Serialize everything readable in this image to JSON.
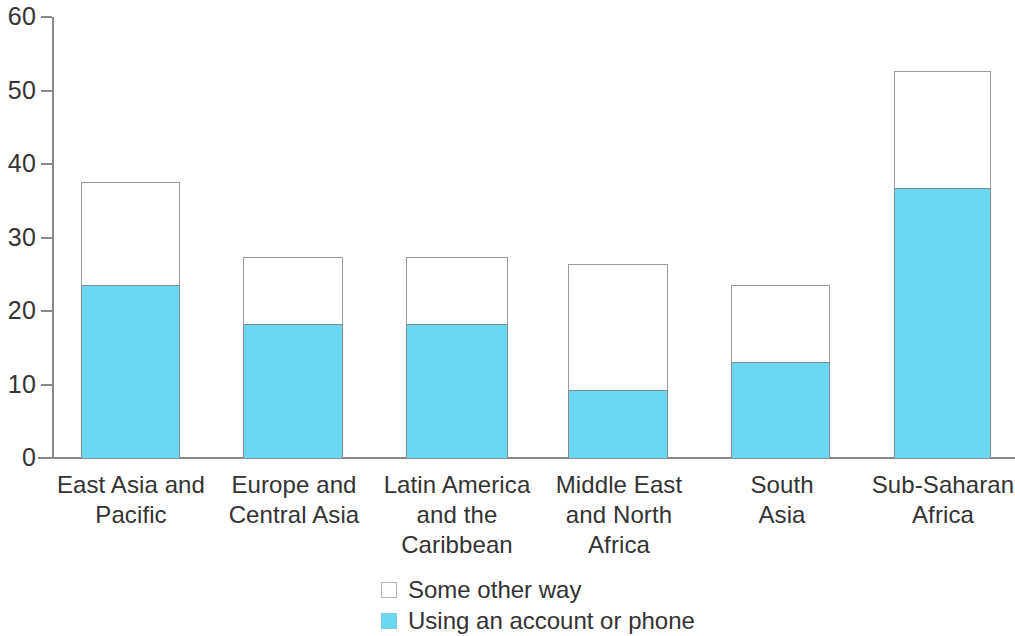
{
  "chart_data": {
    "type": "bar",
    "subtype": "stacked-bar",
    "title": "",
    "subtitle": "",
    "xlabel": "",
    "ylabel": "",
    "ylim": [
      0,
      60
    ],
    "yticks": [
      0,
      10,
      20,
      30,
      40,
      50,
      60
    ],
    "ytick_labels": [
      "0",
      "10",
      "20",
      "30",
      "40",
      "50",
      "60"
    ],
    "grid": false,
    "legend_position": "bottom-center",
    "categories": [
      "East Asia and Pacific",
      "Europe and Central Asia",
      "Latin America and the Caribbean",
      "Middle East and North Africa",
      "South Asia",
      "Sub-Saharan Africa"
    ],
    "category_label_lines": [
      [
        "East Asia and",
        "Pacific"
      ],
      [
        "Europe and",
        "Central Asia"
      ],
      [
        "Latin America",
        "and the",
        "Caribbean"
      ],
      [
        "Middle East",
        "and North",
        "Africa"
      ],
      [
        "South",
        "Asia"
      ],
      [
        "Sub-Saharan",
        "Africa"
      ]
    ],
    "series": [
      {
        "name": "Using an account or phone",
        "color": "#6ad8f0",
        "values": [
          23.6,
          18.3,
          18.3,
          9.2,
          13.0,
          36.8
        ]
      },
      {
        "name": "Some other way",
        "color": "#ffffff",
        "values": [
          14.0,
          9.0,
          9.0,
          17.2,
          10.5,
          15.8
        ]
      }
    ],
    "totals": [
      37.6,
      27.3,
      27.3,
      26.4,
      23.5,
      52.6
    ]
  },
  "legend": {
    "items": [
      {
        "label": "Some other way",
        "style": "hollow"
      },
      {
        "label": "Using an account or phone",
        "style": "filled"
      }
    ]
  },
  "colors": {
    "series_blue": "#6ad8f0",
    "series_white": "#ffffff",
    "axis": "#8a8a8a",
    "text": "#333333",
    "bar_outline": "#9a9a9a"
  }
}
